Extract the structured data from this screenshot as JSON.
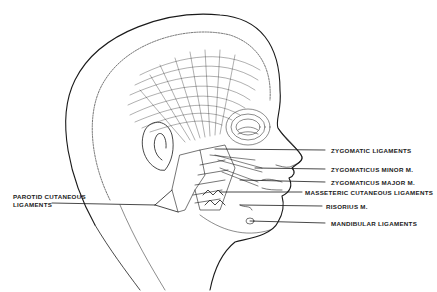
{
  "figure": {
    "type": "anatomical illustration",
    "line_color": "#1a1a1a",
    "background": "#ffffff"
  },
  "labels": {
    "zygomatic_ligaments": "ZYGOMATIC LIGAMENTS",
    "zygomaticus_minor": "ZYGOMATICUS MINOR M.",
    "zygomaticus_major": "ZYGOMATICUS MAJOR M.",
    "masseteric_cutaneous": "MASSETERIC CUTANEOUS LIGAMENTS",
    "risorius": "RISORIUS M.",
    "mandibular_ligaments": "MANDIBULAR LIGAMENTS",
    "parotid_line1": "PAROTID CUTANEOUS",
    "parotid_line2": "LIGAMENTS"
  }
}
